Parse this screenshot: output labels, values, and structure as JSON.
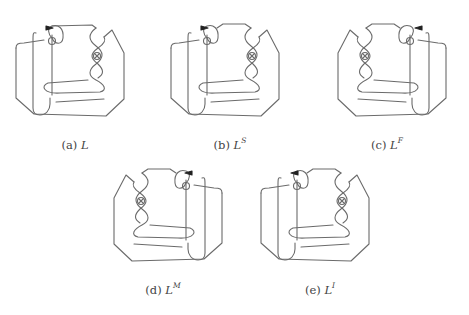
{
  "figure": {
    "subfigures": [
      {
        "id": "a",
        "tag": "(a)",
        "symbol": "L",
        "superscript": ""
      },
      {
        "id": "b",
        "tag": "(b)",
        "symbol": "L",
        "superscript": "S"
      },
      {
        "id": "c",
        "tag": "(c)",
        "symbol": "L",
        "superscript": "F"
      },
      {
        "id": "d",
        "tag": "(d)",
        "symbol": "L",
        "superscript": "M"
      },
      {
        "id": "e",
        "tag": "(e)",
        "symbol": "L",
        "superscript": "I"
      }
    ]
  }
}
